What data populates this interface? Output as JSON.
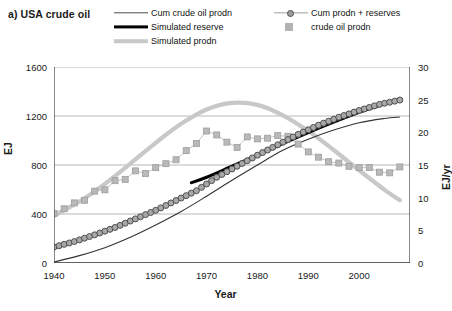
{
  "panel_label": "a) USA crude oil",
  "legend": {
    "position": "top",
    "items": [
      {
        "key": "cum_crude_oil_prodn",
        "label": "Cum crude oil prodn",
        "marker": "line",
        "color": "#4d4d4d"
      },
      {
        "key": "simulated_reserve",
        "label": "Simulated reserve",
        "marker": "thick-line",
        "color": "#000000"
      },
      {
        "key": "simulated_prodn",
        "label": "Simulated prodn",
        "marker": "thick-line",
        "color": "#c8c8c8"
      },
      {
        "key": "cum_prodn_plus_reserves",
        "label": "Cum prodn + reserves",
        "marker": "line-circle",
        "color": "#9e9e9e"
      },
      {
        "key": "crude_oil_prodn",
        "label": "crude oil prodn",
        "marker": "square",
        "color": "#b3b3b3"
      }
    ]
  },
  "chart_data": {
    "type": "line",
    "title": "a) USA crude oil",
    "xlabel": "Year",
    "ylabel": "EJ",
    "y2label": "EJ/yr",
    "xlim": [
      1940,
      2010
    ],
    "ylim": [
      0,
      1600
    ],
    "y2lim": [
      0,
      30
    ],
    "xticks": [
      1940,
      1945,
      1950,
      1955,
      1960,
      1965,
      1970,
      1975,
      1980,
      1985,
      1990,
      1995,
      2000,
      2005,
      2010
    ],
    "xticklabels": [
      "1940",
      "",
      "1950",
      "",
      "1960",
      "",
      "1970",
      "",
      "1980",
      "",
      "1990",
      "",
      "2000",
      "",
      ""
    ],
    "yticks": [
      0,
      400,
      800,
      1200,
      1600
    ],
    "y2ticks": [
      0,
      5,
      10,
      15,
      20,
      25,
      30
    ],
    "grid": "horizontal-left-axis",
    "series": [
      {
        "name": "Cum crude oil prodn",
        "axis": "left",
        "style": "thin-line",
        "color": "#333333",
        "x": [
          1940,
          1945,
          1950,
          1955,
          1960,
          1965,
          1970,
          1975,
          1980,
          1985,
          1990,
          1995,
          2000,
          2005,
          2008
        ],
        "values": [
          8,
          60,
          125,
          210,
          310,
          420,
          545,
          675,
          800,
          920,
          1010,
          1085,
          1145,
          1180,
          1192
        ]
      },
      {
        "name": "Simulated reserve",
        "axis": "left",
        "style": "thick-line",
        "color": "#000000",
        "x": [
          1967,
          1970,
          1975,
          1980,
          1985,
          1990,
          1995,
          2000,
          2005,
          2008
        ],
        "values": [
          655,
          700,
          790,
          880,
          975,
          1065,
          1150,
          1230,
          1300,
          1330
        ]
      },
      {
        "name": "Simulated prodn",
        "axis": "right",
        "style": "thick-line",
        "color": "#c8c8c8",
        "x": [
          1940,
          1945,
          1950,
          1955,
          1960,
          1965,
          1970,
          1975,
          1980,
          1985,
          1990,
          1995,
          2000,
          2005,
          2008
        ],
        "values": [
          7.2,
          9.4,
          12.1,
          15.2,
          18.4,
          21.3,
          23.5,
          24.5,
          24.2,
          22.6,
          20.2,
          17.3,
          14.2,
          11.2,
          9.6
        ]
      },
      {
        "name": "Cum prodn + reserves",
        "axis": "left",
        "style": "line-circle-markers",
        "color": "#9e9e9e",
        "x": [
          1940,
          1944,
          1948,
          1952,
          1956,
          1960,
          1964,
          1968,
          1972,
          1976,
          1980,
          1984,
          1988,
          1992,
          1996,
          2000,
          2004,
          2008
        ],
        "values": [
          130,
          175,
          230,
          290,
          360,
          430,
          510,
          590,
          700,
          790,
          880,
          965,
          1050,
          1125,
          1190,
          1245,
          1295,
          1330
        ]
      },
      {
        "name": "crude oil prodn",
        "axis": "right",
        "style": "square-markers",
        "color": "#b3b3b3",
        "x": [
          1940,
          1942,
          1944,
          1946,
          1948,
          1950,
          1952,
          1954,
          1956,
          1958,
          1960,
          1962,
          1964,
          1966,
          1968,
          1970,
          1972,
          1974,
          1976,
          1978,
          1980,
          1982,
          1984,
          1986,
          1988,
          1990,
          1992,
          1994,
          1996,
          1998,
          2000,
          2002,
          2004,
          2006,
          2008
        ],
        "values": [
          7.6,
          8.3,
          9.2,
          9.6,
          11.0,
          11.2,
          12.6,
          12.8,
          14.1,
          13.7,
          14.6,
          15.2,
          15.8,
          17.2,
          18.3,
          20.2,
          19.6,
          18.5,
          17.7,
          19.3,
          19.0,
          19.1,
          19.5,
          19.4,
          18.2,
          17.0,
          16.2,
          15.5,
          15.3,
          14.8,
          14.6,
          14.6,
          13.9,
          13.8,
          14.7
        ]
      }
    ]
  }
}
